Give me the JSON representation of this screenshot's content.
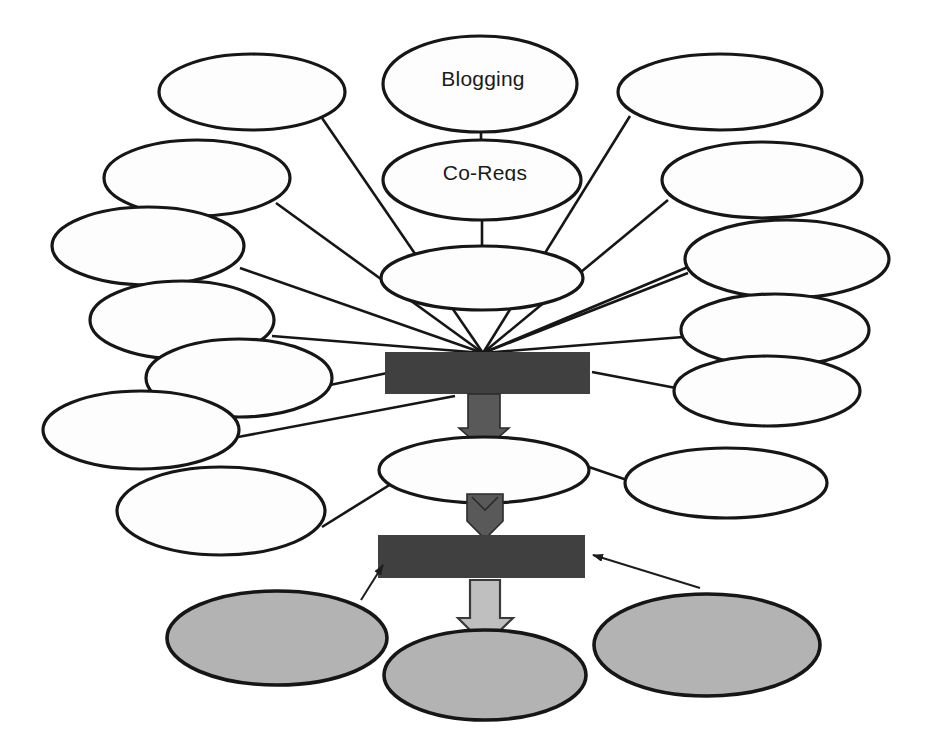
{
  "diagram": {
    "type": "hub-and-spoke flow diagram",
    "canvas": {
      "width": 933,
      "height": 754
    },
    "colors": {
      "background": "#ffffff",
      "outline": "#161616",
      "bar_fill": "#404040",
      "gray_ellipse_fill": "#b3b3b3",
      "dark_arrow_fill": "#595959",
      "light_arrow_fill": "#bfbfbf",
      "white_ellipse_fill": "#fdfdfd"
    },
    "labelled_nodes": [
      {
        "id": "blogging",
        "label": "Blogging",
        "shape": "ellipse",
        "fill": "white",
        "cx": 480,
        "cy": 84,
        "rx": 97,
        "ry": 48
      },
      {
        "id": "co-regs",
        "label": "Co-Regs",
        "shape": "ellipse",
        "fill": "white",
        "cx": 482,
        "cy": 180,
        "rx": 99,
        "ry": 40,
        "note": "label clipped at baseline"
      }
    ],
    "hub_ellipse": {
      "id": "hub-top",
      "label": "",
      "shape": "ellipse",
      "fill": "white",
      "cx": 482,
      "cy": 278,
      "rx": 101,
      "ry": 32
    },
    "mid_ellipse": {
      "id": "mid-node",
      "label": "",
      "shape": "ellipse",
      "fill": "white",
      "cx": 484,
      "cy": 470,
      "rx": 105,
      "ry": 33
    },
    "bars": [
      {
        "id": "bar-upper",
        "label": "",
        "x": 385,
        "y": 352,
        "width": 205,
        "height": 42,
        "fill": "#404040"
      },
      {
        "id": "bar-lower",
        "label": "",
        "x": 378,
        "y": 535,
        "width": 207,
        "height": 43,
        "fill": "#404040"
      }
    ],
    "spoke_ellipses": [
      {
        "id": "spoke-l1",
        "label": "",
        "cx": 252,
        "cy": 92,
        "rx": 93,
        "ry": 38,
        "side": "left"
      },
      {
        "id": "spoke-l2",
        "label": "",
        "cx": 197,
        "cy": 178,
        "rx": 93,
        "ry": 38,
        "side": "left"
      },
      {
        "id": "spoke-l3",
        "label": "",
        "cx": 148,
        "cy": 246,
        "rx": 96,
        "ry": 39,
        "side": "left"
      },
      {
        "id": "spoke-l4",
        "label": "",
        "cx": 182,
        "cy": 320,
        "rx": 92,
        "ry": 39,
        "side": "left"
      },
      {
        "id": "spoke-l5",
        "label": "",
        "cx": 239,
        "cy": 378,
        "rx": 93,
        "ry": 39,
        "side": "left"
      },
      {
        "id": "spoke-l6",
        "label": "",
        "cx": 141,
        "cy": 430,
        "rx": 98,
        "ry": 39,
        "side": "left"
      },
      {
        "id": "spoke-l7",
        "label": "",
        "cx": 221,
        "cy": 511,
        "rx": 104,
        "ry": 44,
        "side": "left"
      },
      {
        "id": "spoke-r1",
        "label": "",
        "cx": 720,
        "cy": 92,
        "rx": 102,
        "ry": 38,
        "side": "right"
      },
      {
        "id": "spoke-r2",
        "label": "",
        "cx": 762,
        "cy": 180,
        "rx": 100,
        "ry": 38,
        "side": "right"
      },
      {
        "id": "spoke-r3",
        "label": "",
        "cx": 787,
        "cy": 259,
        "rx": 102,
        "ry": 39,
        "side": "right"
      },
      {
        "id": "spoke-r4",
        "label": "",
        "cx": 775,
        "cy": 330,
        "rx": 94,
        "ry": 36,
        "side": "right"
      },
      {
        "id": "spoke-r5",
        "label": "",
        "cx": 767,
        "cy": 391,
        "rx": 93,
        "ry": 35,
        "side": "right"
      },
      {
        "id": "spoke-r6",
        "label": "",
        "cx": 726,
        "cy": 483,
        "rx": 101,
        "ry": 35,
        "side": "right"
      }
    ],
    "outcome_ellipses": [
      {
        "id": "outcome-left",
        "label": "",
        "cx": 277,
        "cy": 638,
        "rx": 110,
        "ry": 47,
        "fill": "gray"
      },
      {
        "id": "outcome-center",
        "label": "",
        "cx": 485,
        "cy": 675,
        "rx": 101,
        "ry": 45,
        "fill": "gray"
      },
      {
        "id": "outcome-right",
        "label": "",
        "cx": 707,
        "cy": 645,
        "rx": 113,
        "ry": 51,
        "fill": "gray"
      }
    ],
    "arrows": [
      {
        "id": "arrow-bar-to-mid",
        "from": "bar-upper",
        "to": "mid-node",
        "style": "dark-chevron",
        "direction": "down"
      },
      {
        "id": "arrow-mid-to-bar",
        "from": "mid-node",
        "to": "bar-lower",
        "style": "dark-chevron",
        "direction": "down"
      },
      {
        "id": "arrow-bar-to-outcome",
        "from": "bar-lower",
        "to": "outcome-center",
        "style": "light-outline",
        "direction": "down"
      },
      {
        "id": "arrow-outcome-left-to-bar",
        "from": "outcome-left",
        "to": "bar-lower",
        "style": "thin-line",
        "direction": "up"
      },
      {
        "id": "arrow-outcome-right-to-bar",
        "from": "outcome-right",
        "to": "bar-lower",
        "style": "thin-line",
        "direction": "left"
      }
    ],
    "convergence_point": {
      "x": 483,
      "y": 353,
      "description": "all spoke lines converge at top edge of upper bar"
    }
  }
}
